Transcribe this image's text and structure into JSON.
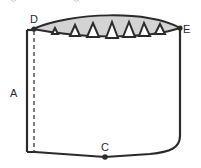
{
  "diagram": {
    "type": "sewing-pattern",
    "labels": {
      "a": "A",
      "c": "C",
      "d": "D",
      "e": "E"
    },
    "colors": {
      "stroke": "#2b2b2b",
      "fill_gathered": "#d3d3d3",
      "background": "#ffffff"
    },
    "dart_count": 7
  }
}
